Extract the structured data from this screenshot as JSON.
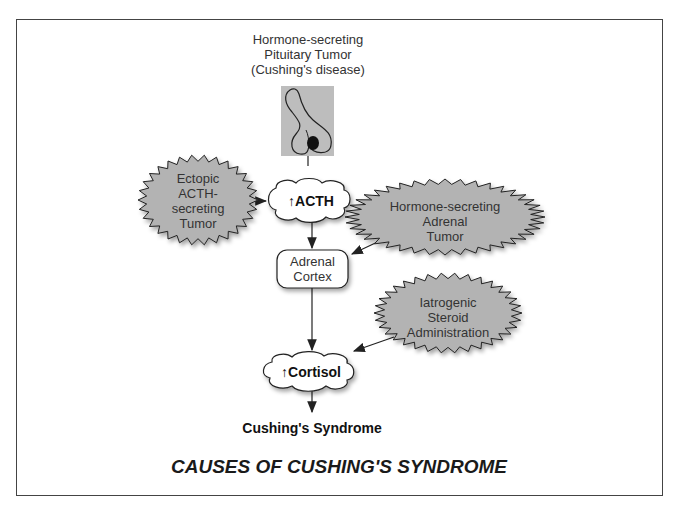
{
  "title": "CAUSES OF CUSHING'S SYNDROME",
  "nodes": {
    "pituitary": {
      "line1": "Hormone-secreting",
      "line2": "Pituitary Tumor",
      "line3": "(Cushing's disease)"
    },
    "ectopic": {
      "line1": "Ectopic",
      "line2": "ACTH-",
      "line3": "secreting",
      "line4": "Tumor"
    },
    "acth": {
      "label": "↑ACTH"
    },
    "adrenal_tumor": {
      "line1": "Hormone-secreting",
      "line2": "Adrenal",
      "line3": "Tumor"
    },
    "adrenal_cortex": {
      "line1": "Adrenal",
      "line2": "Cortex"
    },
    "iatrogenic": {
      "line1": "Iatrogenic",
      "line2": "Steroid",
      "line3": "Administration"
    },
    "cortisol": {
      "label": "↑Cortisol"
    },
    "outcome": {
      "label": "Cushing's Syndrome"
    }
  },
  "colors": {
    "burst_fill": "#b3b3b3",
    "pituitary_bg": "#bdbdbd",
    "stroke": "#222222"
  }
}
